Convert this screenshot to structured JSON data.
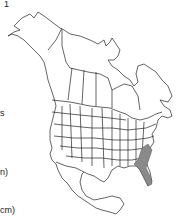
{
  "left_text_fragments": [
    {
      "text": "1",
      "y": 0
    },
    {
      "text": "s",
      "y": 109
    },
    {
      "text": "n)",
      "y": 168
    },
    {
      "text": "cm)",
      "y": 206
    }
  ],
  "map": {
    "region": "North America",
    "boundaries": [
      "countries",
      "US states",
      "Canadian provinces",
      "Mexican states outline"
    ],
    "range_color": "#8a8a8a",
    "outline_color": "#222222",
    "range_description": "Coastal South Carolina, southeastern Georgia, and northern Florida"
  }
}
